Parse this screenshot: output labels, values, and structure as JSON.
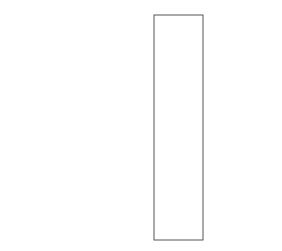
{
  "pointers": [
    {
      "label": "a",
      "target": "a[0]"
    },
    {
      "label": "a+1",
      "target": "a[1]"
    },
    {
      "label": "a+2",
      "target": "a[2]"
    }
  ],
  "rows": [
    {
      "label": "a[0]"
    },
    {
      "label": "a[1]"
    },
    {
      "label": "a[2]"
    }
  ],
  "cells": [
    {
      "address": "1245008",
      "value": "1"
    },
    {
      "address": "1245012",
      "value": "2"
    },
    {
      "address": "1245016",
      "value": "3"
    },
    {
      "address": "1245020",
      "value": "4"
    },
    {
      "address": "1245024",
      "value": "5"
    },
    {
      "address": "1245028",
      "value": "6"
    },
    {
      "address": "1245032",
      "value": "7"
    },
    {
      "address": "1245036",
      "value": "8"
    },
    {
      "address": "1245040",
      "value": "9"
    },
    {
      "address": "1245044",
      "value": "10"
    },
    {
      "address": "1245048",
      "value": "11"
    },
    {
      "address": "1245052",
      "value": "12"
    }
  ],
  "right_labels": [
    {
      "label": "a[0]",
      "cell_index": 0
    },
    {
      "label": "a[0]+1",
      "cell_index": 1
    },
    {
      "label": "a[0]+2",
      "cell_index": 2
    },
    {
      "label": "a[1]",
      "cell_index": 4
    },
    {
      "label": "a[2]",
      "cell_index": 8
    }
  ]
}
